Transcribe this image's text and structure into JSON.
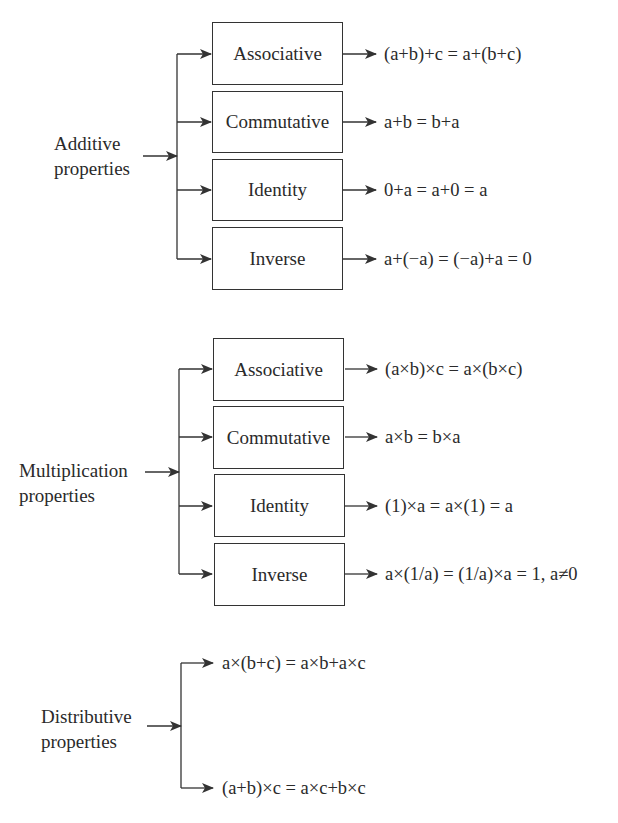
{
  "groups": [
    {
      "label_line1": "Additive",
      "label_line2": "properties",
      "items": [
        {
          "name": "Associative",
          "formula": "(a+b)+c = a+(b+c)"
        },
        {
          "name": "Commutative",
          "formula": "a+b = b+a"
        },
        {
          "name": "Identity",
          "formula": "0+a = a+0 = a"
        },
        {
          "name": "Inverse",
          "formula": "a+(−a) = (−a)+a = 0"
        }
      ]
    },
    {
      "label_line1": "Multiplication",
      "label_line2": "properties",
      "items": [
        {
          "name": "Associative",
          "formula": "(a×b)×c = a×(b×c)"
        },
        {
          "name": "Commutative",
          "formula": "a×b = b×a"
        },
        {
          "name": "Identity",
          "formula": "(1)×a = a×(1) = a"
        },
        {
          "name": "Inverse",
          "formula": "a×(1/a) = (1/a)×a = 1, a≠0"
        }
      ]
    },
    {
      "label_line1": "Distributive",
      "label_line2": "properties",
      "items": [
        {
          "formula": "a×(b+c) = a×b+a×c"
        },
        {
          "formula": "(a+b)×c = a×c+b×c"
        }
      ]
    }
  ]
}
